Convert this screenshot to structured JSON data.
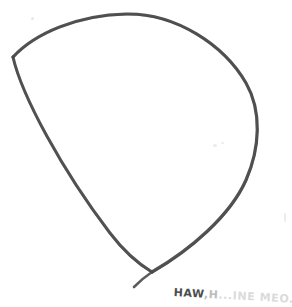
{
  "document": {
    "title": "Hand-drawn sketch",
    "medium": "pencil on paper",
    "background_color": "#ffffff",
    "width": 292,
    "height": 307
  },
  "drawing": {
    "name": "teardrop-outline",
    "description": "Closed hand-drawn teardrop / leaf outline with a sharp vertex at upper left and a pointed vertex at bottom",
    "stroke_color": "#4a4a4a",
    "stroke_width": 3,
    "vertices": {
      "upper_left": {
        "x": 13,
        "y": 57
      },
      "apex_top": {
        "x": 126,
        "y": 14
      },
      "rightmost": {
        "x": 258,
        "y": 112
      },
      "bottom_point": {
        "x": 152,
        "y": 272
      }
    },
    "paths": {
      "top_right_arc": "M 13,57 C 35,33 78,15 126,14 C 176,13 224,45 246,83 C 262,111 260,148 246,180 C 230,216 190,250 152,272",
      "left_edge": "M 13,57 C 22,96 62,170 110,233 C 126,254 142,266 152,272",
      "tail": "M 152,272 C 146,276 140,281 134,287"
    }
  },
  "annotation": {
    "name": "handwritten-caption",
    "full_text": "HAW.H..INE MEO...",
    "segments": [
      {
        "text": "HAW",
        "legibility": "clear"
      },
      {
        "text": ",H",
        "legibility": "faint"
      },
      {
        "text": "...INE MEO...",
        "legibility": "very-faint"
      }
    ],
    "text_color": "#5a5a5a",
    "rotation_degrees": 3.2,
    "clipped_at_edge": true
  },
  "marks": [
    {
      "name": "smudge-upper-left",
      "x": 31,
      "y": 17,
      "size": 3,
      "opacity": 0.35
    },
    {
      "name": "smudge-mid-right",
      "x": 213,
      "y": 144,
      "size": 4,
      "opacity": 0.3
    },
    {
      "name": "smudge-mid-right-2",
      "x": 221,
      "y": 142,
      "size": 3,
      "opacity": 0.28
    },
    {
      "name": "smudge-right-edge",
      "x": 284,
      "y": 217,
      "size": 3,
      "opacity": 0.25
    }
  ]
}
